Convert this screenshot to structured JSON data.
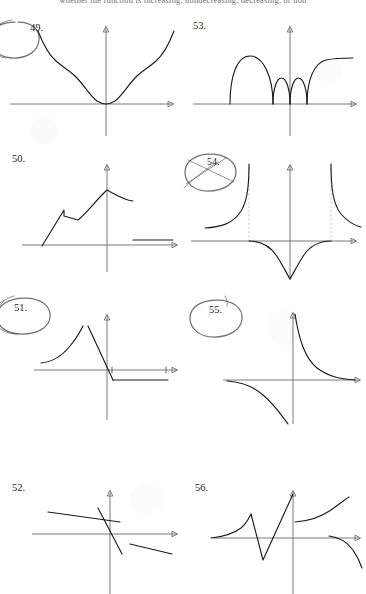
{
  "page": {
    "header_text": "whether the function is increasing, nondecreasing, decreasing, or non",
    "background_color": "#ffffff",
    "ink_color": "#1c1c1c",
    "axis_color": "#6b6b6b",
    "pen_annotation_color": "#3a3a46"
  },
  "exercises": [
    {
      "number": "49.",
      "circled": true,
      "description": "Symmetric U-shaped curve touching the x-axis at the origin with flattened shoulders and steeply rising tails",
      "column": "left",
      "row": 1
    },
    {
      "number": "53.",
      "circled": false,
      "description": "One large arch and two small arches sitting on the x-axis, then a curve rising to a horizontal asymptote on the right",
      "column": "right",
      "row": 1
    },
    {
      "number": "50.",
      "circled": false,
      "description": "Line rising from the x-axis with a sawtooth notch, curving to a maximum near the y-axis then descending; separate horizontal segment at right",
      "column": "left",
      "row": 2
    },
    {
      "number": "54.",
      "circled": true,
      "description": "Two vertical asymptotes with branches increasing to positive infinity outside; inside, a dome dipping to negative infinity at the origin",
      "column": "right",
      "row": 2
    },
    {
      "number": "51.",
      "circled": true,
      "description": "Concave increasing curve, jump discontinuity, steep decreasing line through the origin, then a flat horizontal ray",
      "column": "left",
      "row": 3
    },
    {
      "number": "55.",
      "circled": true,
      "description": "Hyperbola y = 1/x with branches in the first and third quadrants",
      "column": "right",
      "row": 3
    },
    {
      "number": "52.",
      "circled": false,
      "description": "Three disconnected line segments with negative slopes: two shallow and one steep crossing the origin",
      "column": "left",
      "row": 4
    },
    {
      "number": "56.",
      "circled": false,
      "description": "Curve rising to a small peak, sharp V dip below the axis, steep rise to a jump, increasing branch, then a separate decreasing branch at right",
      "column": "right",
      "row": 4
    }
  ]
}
